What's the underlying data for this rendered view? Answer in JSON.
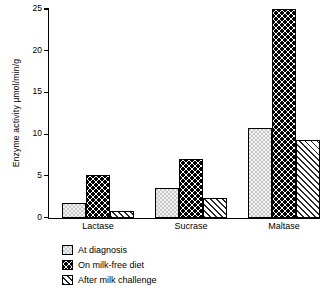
{
  "chart_data": {
    "type": "bar",
    "title": "",
    "xlabel": "",
    "ylabel": "Enzyme activity µmol/min/g",
    "ylim": [
      0,
      25
    ],
    "yticks": [
      0,
      5,
      10,
      15,
      20,
      25
    ],
    "grid": false,
    "legend_position": "below-left",
    "categories": [
      "Lactase",
      "Sucrase",
      "Maltase"
    ],
    "series": [
      {
        "name": "At diagnosis",
        "pattern": "fine-check-grey",
        "values": [
          1.7,
          3.6,
          10.7
        ]
      },
      {
        "name": "On milk-free diet",
        "pattern": "bold-checker",
        "values": [
          5.1,
          7.0,
          25.0
        ]
      },
      {
        "name": "After milk challenge",
        "pattern": "diagonal-hatch",
        "values": [
          0.8,
          2.3,
          9.3
        ]
      }
    ]
  },
  "legend": {
    "items": [
      {
        "label": "At diagnosis"
      },
      {
        "label": "On milk-free diet"
      },
      {
        "label": "After milk challenge"
      }
    ]
  },
  "colors": {
    "axis": "#000000",
    "diagnosis_fill": "#c9c9c9",
    "milkfree_fill": "#000000",
    "challenge_fill": "#2a2a2a",
    "background": "#ffffff"
  }
}
